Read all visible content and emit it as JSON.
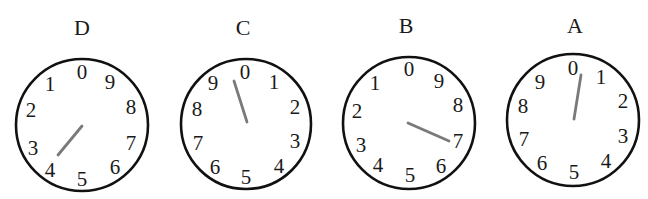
{
  "figure": {
    "colors": {
      "ring": "#111111",
      "pointer": "#7a7a7a",
      "text": "#1a1a1a"
    }
  },
  "dials": [
    {
      "label": "D",
      "label_pos": [
        82,
        28
      ],
      "center": [
        82,
        125
      ],
      "radius": 66,
      "direction": "counterclockwise",
      "digits": [
        "0",
        "1",
        "2",
        "3",
        "4",
        "5",
        "6",
        "7",
        "8",
        "9"
      ],
      "digit_positions": [
        [
          82,
          72
        ],
        [
          50,
          84
        ],
        [
          31,
          110
        ],
        [
          33,
          148
        ],
        [
          50,
          170
        ],
        [
          82,
          179
        ],
        [
          115,
          167
        ],
        [
          131,
          143
        ],
        [
          131,
          107
        ],
        [
          110,
          82
        ]
      ],
      "pointer": {
        "from": [
          82,
          126
        ],
        "to": [
          58,
          155
        ],
        "reading": "between 3 and 4 (≈4)"
      }
    },
    {
      "label": "C",
      "label_pos": [
        243,
        28
      ],
      "center": [
        246,
        124
      ],
      "radius": 65,
      "direction": "clockwise",
      "digits": [
        "0",
        "1",
        "2",
        "3",
        "4",
        "5",
        "6",
        "7",
        "8",
        "9"
      ],
      "digit_positions": [
        [
          245,
          72
        ],
        [
          274,
          82
        ],
        [
          295,
          107
        ],
        [
          295,
          141
        ],
        [
          279,
          166
        ],
        [
          246,
          177
        ],
        [
          215,
          167
        ],
        [
          198,
          143
        ],
        [
          197,
          109
        ],
        [
          213,
          83
        ]
      ],
      "pointer": {
        "from": [
          247,
          122
        ],
        "to": [
          234,
          81
        ],
        "reading": "between 9 and 0 (≈9)"
      }
    },
    {
      "label": "B",
      "label_pos": [
        406,
        26
      ],
      "center": [
        409,
        123
      ],
      "radius": 66,
      "direction": "counterclockwise",
      "digits": [
        "0",
        "1",
        "2",
        "3",
        "4",
        "5",
        "6",
        "7",
        "8",
        "9"
      ],
      "digit_positions": [
        [
          409,
          69
        ],
        [
          375,
          83
        ],
        [
          357,
          111
        ],
        [
          361,
          145
        ],
        [
          378,
          165
        ],
        [
          410,
          175
        ],
        [
          441,
          166
        ],
        [
          458,
          141
        ],
        [
          458,
          105
        ],
        [
          439,
          81
        ]
      ],
      "pointer": {
        "from": [
          408,
          123
        ],
        "to": [
          449,
          141
        ],
        "reading": "between 6 and 7 (≈7)"
      }
    },
    {
      "label": "A",
      "label_pos": [
        575,
        26
      ],
      "center": [
        573,
        120
      ],
      "radius": 66,
      "direction": "clockwise",
      "digits": [
        "0",
        "1",
        "2",
        "3",
        "4",
        "5",
        "6",
        "7",
        "8",
        "9"
      ],
      "digit_positions": [
        [
          573,
          68
        ],
        [
          601,
          77
        ],
        [
          623,
          101
        ],
        [
          623,
          136
        ],
        [
          606,
          161
        ],
        [
          574,
          172
        ],
        [
          542,
          163
        ],
        [
          524,
          139
        ],
        [
          523,
          106
        ],
        [
          540,
          82
        ]
      ],
      "pointer": {
        "from": [
          574,
          119
        ],
        "to": [
          581,
          75
        ],
        "reading": "between 0 and 1 (≈0)"
      }
    }
  ]
}
